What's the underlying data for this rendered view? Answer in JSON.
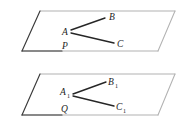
{
  "figure": {
    "type": "geometry-diagram",
    "colors": {
      "edge_dark": "#3a3a3a",
      "edge_light": "#b2b2b2",
      "ray": "#262626",
      "label": "#1c1c1c",
      "background": "#ffffff"
    },
    "planes": [
      {
        "name": "upper-plane",
        "vertices": [
          {
            "x": 40,
            "y": 11
          },
          {
            "x": 175,
            "y": 11
          },
          {
            "x": 158,
            "y": 51
          },
          {
            "x": 22,
            "y": 51
          }
        ]
      },
      {
        "name": "lower-plane",
        "vertices": [
          {
            "x": 40,
            "y": 74
          },
          {
            "x": 175,
            "y": 74
          },
          {
            "x": 158,
            "y": 115
          },
          {
            "x": 22,
            "y": 115
          }
        ]
      }
    ],
    "upper": {
      "vertex": {
        "label": "A",
        "sub": "",
        "x": 70,
        "y": 32
      },
      "arm_b": {
        "label": "B",
        "sub": "",
        "x": 112,
        "y": 17
      },
      "arm_c": {
        "label": "C",
        "sub": "",
        "x": 120,
        "y": 44
      },
      "foot": {
        "label": "P",
        "sub": "",
        "x": 66,
        "y": 49
      },
      "rays": [
        {
          "name": "segment-AB",
          "x1": 71,
          "y1": 30,
          "x2": 105,
          "y2": 18
        },
        {
          "name": "segment-AC",
          "x1": 71,
          "y1": 33,
          "x2": 114,
          "y2": 43
        }
      ]
    },
    "lower": {
      "vertex": {
        "label": "A",
        "sub": "1",
        "x": 62,
        "y": 92
      },
      "arm_b": {
        "label": "B",
        "sub": "1",
        "x": 112,
        "y": 82
      },
      "arm_c": {
        "label": "C",
        "sub": "1",
        "x": 120,
        "y": 107
      },
      "foot": {
        "label": "Q",
        "sub": "",
        "x": 65,
        "y": 105
      },
      "rays": [
        {
          "name": "segment-A1B1",
          "x1": 73,
          "y1": 94,
          "x2": 106,
          "y2": 82
        },
        {
          "name": "segment-A1C1",
          "x1": 73,
          "y1": 96,
          "x2": 114,
          "y2": 106
        }
      ]
    }
  }
}
